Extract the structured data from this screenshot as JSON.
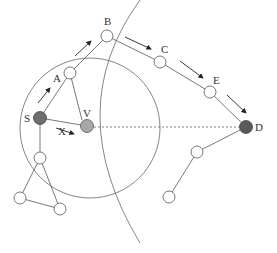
{
  "diagram": {
    "labels": {
      "S": "S",
      "V": "V",
      "A": "A",
      "B": "B",
      "C": "C",
      "E": "E",
      "D": "D",
      "X": "X"
    },
    "colors": {
      "line": "#555555",
      "node_fill": "#ffffff",
      "source_fill": "#6e6e6e",
      "virtual_fill": "#a8a8a8",
      "dest_fill": "#5a5a5a"
    },
    "nodes": [
      {
        "id": "S",
        "x": 40,
        "y": 118,
        "kind": "source"
      },
      {
        "id": "V",
        "x": 87,
        "y": 126,
        "kind": "virtual"
      },
      {
        "id": "A",
        "x": 70,
        "y": 73,
        "kind": "relay"
      },
      {
        "id": "B",
        "x": 107,
        "y": 36,
        "kind": "relay"
      },
      {
        "id": "C",
        "x": 160,
        "y": 62,
        "kind": "relay"
      },
      {
        "id": "E",
        "x": 210,
        "y": 92,
        "kind": "relay"
      },
      {
        "id": "D",
        "x": 246,
        "y": 127,
        "kind": "destination"
      }
    ],
    "path": [
      "S",
      "A",
      "B",
      "C",
      "E",
      "D"
    ]
  }
}
